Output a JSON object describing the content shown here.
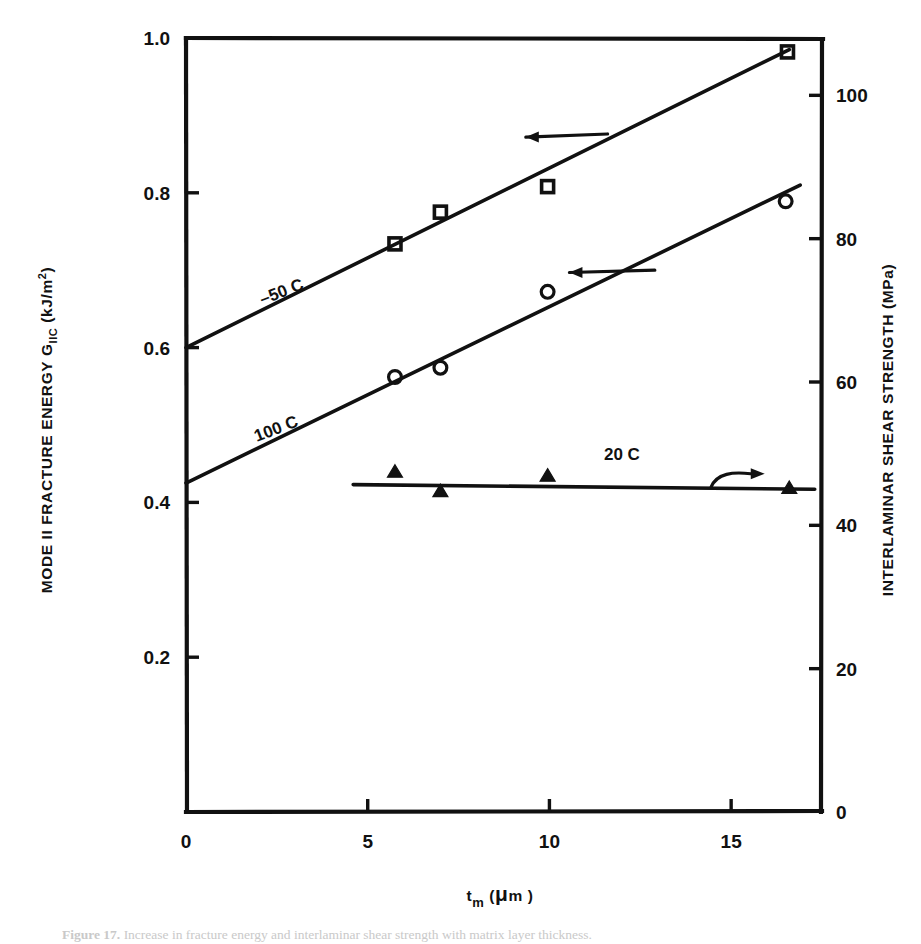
{
  "figure": {
    "caption_label": "Figure 17.",
    "caption_text": "Increase in fracture energy and interlaminar shear strength with matrix layer thickness."
  },
  "chart_data": {
    "type": "scatter",
    "title": "",
    "xlabel": "t_m(μm)",
    "ylabel": "MODE II FRACTURE ENERGY  G_IIC  (kJ/m²)",
    "y2label": "INTERLAMINAR SHEAR STRENGTH (MPa)",
    "xlim": [
      0,
      17.5
    ],
    "ylim": [
      0,
      1.0
    ],
    "y2lim": [
      0,
      108
    ],
    "grid": false,
    "legend": "inline-annotations",
    "xticks": [
      0,
      5,
      10,
      15
    ],
    "xticklabels": [
      "0",
      "5",
      "10",
      "15"
    ],
    "yticks": [
      0.2,
      0.4,
      0.6,
      0.8,
      1.0
    ],
    "yticklabels": [
      "0.2",
      "0.4",
      "0.6",
      "0.8",
      "1.0"
    ],
    "y2ticks": [
      0,
      20,
      40,
      60,
      80,
      100
    ],
    "y2ticklabels": [
      "0",
      "20",
      "40",
      "60",
      "80",
      "100"
    ],
    "series": [
      {
        "name": "-50 C",
        "marker": "open-square",
        "axis": "left",
        "label": "–50 C",
        "label_x": 2.1,
        "label_y": 0.655,
        "label_rotation": -21,
        "fit_line": {
          "x0": 0.0,
          "y0": 0.6,
          "x1": 16.6,
          "y1": 0.985
        },
        "points": [
          {
            "x": 5.75,
            "y": 0.734
          },
          {
            "x": 7.0,
            "y": 0.775
          },
          {
            "x": 9.95,
            "y": 0.808
          },
          {
            "x": 16.55,
            "y": 0.982
          }
        ],
        "arrow": {
          "tail_x": 11.6,
          "tail_y": 0.876,
          "head_x": 9.35,
          "head_y": 0.872,
          "direction": "left"
        }
      },
      {
        "name": "100 C",
        "marker": "open-circle",
        "axis": "left",
        "label": "100 C",
        "label_x": 1.95,
        "label_y": 0.478,
        "label_rotation": -21,
        "fit_line": {
          "x0": 0.0,
          "y0": 0.425,
          "x1": 16.9,
          "y1": 0.81
        },
        "points": [
          {
            "x": 5.75,
            "y": 0.562
          },
          {
            "x": 7.0,
            "y": 0.574
          },
          {
            "x": 9.95,
            "y": 0.672
          },
          {
            "x": 16.5,
            "y": 0.789
          }
        ],
        "arrow": {
          "tail_x": 12.9,
          "tail_y": 0.7,
          "head_x": 10.55,
          "head_y": 0.697,
          "direction": "left"
        }
      },
      {
        "name": "20 C",
        "marker": "filled-triangle",
        "axis": "right",
        "label": "20 C",
        "label_x": 11.5,
        "label_y": 0.455,
        "label_rotation": 0,
        "fit_line": {
          "x0": 4.6,
          "y0": 0.423,
          "x1": 17.3,
          "y1": 0.417
        },
        "points": [
          {
            "x": 5.75,
            "y": 0.437
          },
          {
            "x": 7.0,
            "y": 0.412
          },
          {
            "x": 9.95,
            "y": 0.432
          },
          {
            "x": 16.6,
            "y": 0.416
          }
        ],
        "arrow": {
          "tail_x": 14.45,
          "tail_y": 0.42,
          "head_x": 15.65,
          "head_y": 0.437,
          "direction": "right-curved"
        }
      }
    ]
  }
}
